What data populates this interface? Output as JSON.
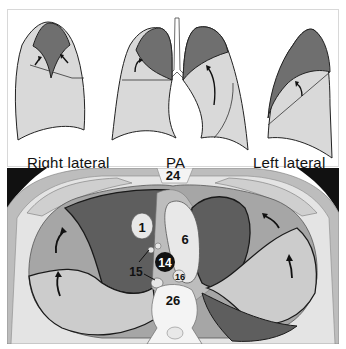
{
  "figure": {
    "top_panel": {
      "views": [
        {
          "id": "right-lateral",
          "label": "Right lateral"
        },
        {
          "id": "pa",
          "label": "PA"
        },
        {
          "id": "left-lateral",
          "label": "Left lateral"
        }
      ]
    },
    "bottom_panel": {
      "type": "axial-ct-schematic",
      "numbered_labels": [
        "24",
        "1",
        "6",
        "14",
        "15",
        "16",
        "26"
      ]
    },
    "colors": {
      "collapsed_lobe": "#6f6f6f",
      "normal_lung": "#d9d9d9",
      "mid_gray": "#a6a6a6",
      "dark_gray": "#5e5e5e",
      "outline": "#1a1a1a",
      "background_black": "#111111",
      "white": "#ffffff"
    }
  }
}
